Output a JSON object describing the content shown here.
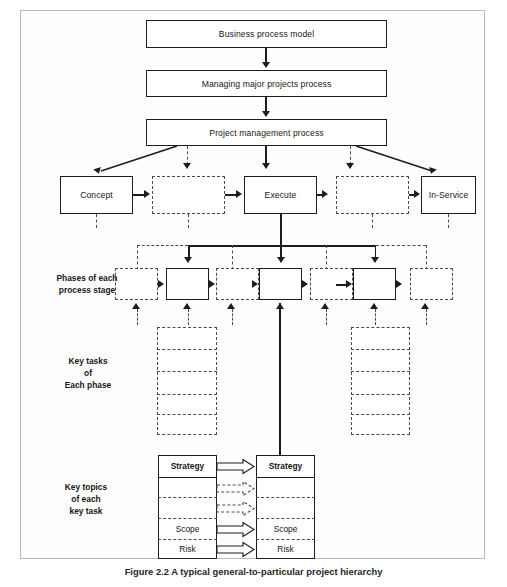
{
  "figure": {
    "caption": "Figure 2.2   A typical general-to-particular project hierarchy",
    "frame_border_color": "#b9b9b9",
    "line_color": "#1d1d1d",
    "dashed_color": "#4a4a4a",
    "background": "#ffffff"
  },
  "hierarchy": {
    "level1": {
      "label": "Business process model"
    },
    "level2": {
      "label": "Managing major projects process"
    },
    "level3": {
      "label": "Project management process"
    }
  },
  "stages": {
    "named": [
      {
        "label": "Concept",
        "style": "solid"
      },
      {
        "label": "Execute",
        "style": "solid"
      },
      {
        "label": "In-Service",
        "style": "solid"
      }
    ],
    "placeholders": [
      {
        "label": "",
        "style": "dashed"
      },
      {
        "label": "",
        "style": "dashed"
      }
    ]
  },
  "row_labels": {
    "phases": "Phases of each\nprocess stage",
    "key_tasks": "Key tasks\nof\nEach phase",
    "key_topics": "Key topics\nof each\nkey task"
  },
  "phases": {
    "boxes": [
      {
        "label": "",
        "style": "dashed"
      },
      {
        "label": "",
        "style": "solid"
      },
      {
        "label": "",
        "style": "dashed"
      },
      {
        "label": "",
        "style": "solid"
      },
      {
        "label": "",
        "style": "dashed"
      },
      {
        "label": "",
        "style": "solid"
      },
      {
        "label": "",
        "style": "dashed"
      }
    ]
  },
  "key_tasks": {
    "left_stack": {
      "rows": [
        "",
        "",
        "",
        ""
      ],
      "style": "dashed"
    },
    "right_stack": {
      "rows": [
        "",
        "",
        "",
        "",
        ""
      ],
      "style": "dashed"
    }
  },
  "key_topics": {
    "left_box": {
      "style": "solid",
      "rows": [
        {
          "label": "Strategy",
          "bold": true,
          "divider": "solid"
        },
        {
          "label": "",
          "bold": false,
          "divider": "dashed"
        },
        {
          "label": "",
          "bold": false,
          "divider": "dashed"
        },
        {
          "label": "Scope",
          "bold": false,
          "divider": "dashed"
        },
        {
          "label": "Risk",
          "bold": false,
          "divider": "none"
        }
      ]
    },
    "right_box": {
      "style": "solid",
      "rows": [
        {
          "label": "Strategy",
          "bold": true,
          "divider": "solid"
        },
        {
          "label": "",
          "bold": false,
          "divider": "dashed"
        },
        {
          "label": "",
          "bold": false,
          "divider": "dashed"
        },
        {
          "label": "Scope",
          "bold": false,
          "divider": "dashed"
        },
        {
          "label": "Risk",
          "bold": false,
          "divider": "none"
        }
      ]
    },
    "connectors": [
      {
        "style": "solid",
        "from_row": 0
      },
      {
        "style": "dashed",
        "from_row": 1
      },
      {
        "style": "dashed",
        "from_row": 2
      },
      {
        "style": "solid",
        "from_row": 3
      },
      {
        "style": "solid",
        "from_row": 4
      }
    ]
  }
}
